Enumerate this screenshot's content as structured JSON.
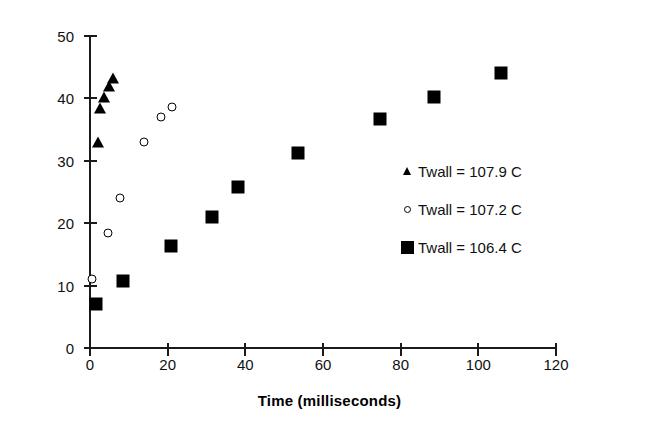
{
  "chart_data": {
    "type": "scatter",
    "title": "",
    "xlabel": "Time (milliseconds)",
    "ylabel": "Bubble Radius  (micrometers)",
    "xlim": [
      0,
      120
    ],
    "ylim": [
      0,
      50
    ],
    "xticks": [
      0,
      20,
      40,
      60,
      80,
      100,
      120
    ],
    "yticks": [
      0,
      10,
      20,
      30,
      40,
      50
    ],
    "grid": false,
    "legend_position": "center-right",
    "series": [
      {
        "name": "Twall = 107.9 C",
        "marker": "filled-triangle",
        "color": "#000000",
        "points": [
          [
            2.0,
            33.0
          ],
          [
            2.6,
            38.5
          ],
          [
            3.6,
            40.2
          ],
          [
            5.0,
            42.0
          ],
          [
            5.8,
            43.2
          ]
        ]
      },
      {
        "name": "Twall = 107.2 C",
        "marker": "open-circle",
        "color": "#000000",
        "points": [
          [
            0.6,
            11.1
          ],
          [
            4.6,
            18.5
          ],
          [
            7.6,
            24.1
          ],
          [
            13.8,
            33.0
          ],
          [
            18.4,
            37.0
          ],
          [
            21.0,
            38.6
          ]
        ]
      },
      {
        "name": "Twall = 106.4 C",
        "marker": "filled-square",
        "color": "#000000",
        "points": [
          [
            1.6,
            7.1
          ],
          [
            8.6,
            10.8
          ],
          [
            20.8,
            16.4
          ],
          [
            31.4,
            21.0
          ],
          [
            38.0,
            25.8
          ],
          [
            53.6,
            31.3
          ],
          [
            74.6,
            36.7
          ],
          [
            88.6,
            40.3
          ],
          [
            105.8,
            44.0
          ]
        ]
      }
    ]
  },
  "axes": {
    "x_title": "Time (milliseconds)",
    "y_title": "Bubble Radius  (micrometers)",
    "x_tick_labels": [
      "0",
      "20",
      "40",
      "60",
      "80",
      "100",
      "120"
    ],
    "y_tick_labels": [
      "0",
      "10",
      "20",
      "30",
      "40",
      "50"
    ]
  },
  "legend": {
    "items": [
      {
        "label": "Twall = 107.9 C",
        "marker": "filled-triangle"
      },
      {
        "label": "Twall = 107.2 C",
        "marker": "open-circle"
      },
      {
        "label": "Twall = 106.4 C",
        "marker": "filled-square"
      }
    ]
  }
}
